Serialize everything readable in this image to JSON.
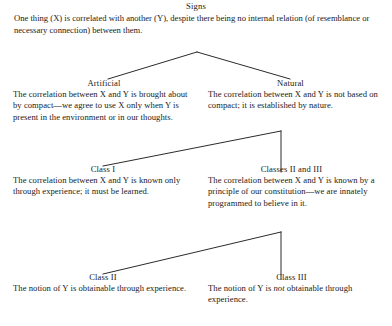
{
  "diagram": {
    "title": "Signs",
    "root": {
      "label": "Signs",
      "body": "One thing (X) is correlated with another (Y), despite there being no internal relation (of resemblance or necessary connection) between them."
    },
    "nodes": [
      {
        "id": "artificial",
        "label": "Artificial",
        "body": "The correlation between X and Y is brought about by compact—we agree to use X only when Y is present in the environment or in our thoughts."
      },
      {
        "id": "natural",
        "label": "Natural",
        "body": "The correlation between X and Y is not based on compact; it is established by nature."
      },
      {
        "id": "class1",
        "label": "Class I",
        "body": "The correlation between X and Y is known only through experience; it must be learned."
      },
      {
        "id": "classes23",
        "label": "Classes II and III",
        "body": "The correlation between X and Y is known by a principle of our constitution—we are innately programmed to believe in it."
      },
      {
        "id": "class2",
        "label": "Class II",
        "body": "The notion of Y is obtainable through experience."
      },
      {
        "id": "class3",
        "label": "Class III",
        "body_prefix": "The notion of Y is ",
        "body_emphasis": "not",
        "body_suffix": " obtainable through experience."
      }
    ],
    "colors": {
      "background": "#ffffff",
      "text": "#1a1a1a",
      "line": "#2b2b2b"
    },
    "connectors": [
      {
        "name": "signs-to-artificial-natural",
        "apex_x": 197,
        "apex_y": 52,
        "left_x": 108,
        "left_y": 79,
        "right_x": 290,
        "right_y": 79
      },
      {
        "name": "natural-to-class1-classes23",
        "apex_x": 281,
        "apex_y": 131,
        "left_x": 103,
        "left_y": 166,
        "down_y": 172
      },
      {
        "name": "classes23-to-class2-class3",
        "apex_x": 281,
        "apex_y": 232,
        "left_x": 103,
        "left_y": 274,
        "down_y": 279
      }
    ]
  }
}
